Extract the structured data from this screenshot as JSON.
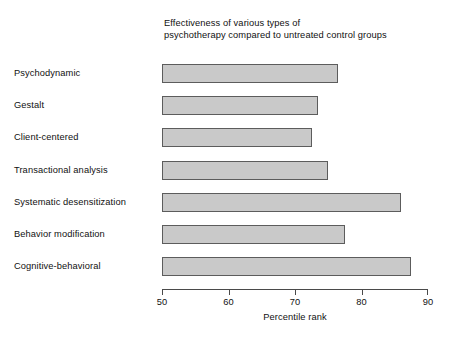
{
  "chart_data": {
    "type": "bar",
    "orientation": "horizontal",
    "title": "Effectiveness of various types of psychotherapy compared to untreated control groups",
    "title_lines": [
      "Effectiveness of various types of",
      "psychotherapy compared to untreated control groups"
    ],
    "categories": [
      "Psychodynamic",
      "Gestalt",
      "Client-centered",
      "Transactional analysis",
      "Systematic desensitization",
      "Behavior modification",
      "Cognitive-behavioral"
    ],
    "values": [
      76.5,
      73.5,
      72.5,
      75,
      86,
      77.5,
      87.5
    ],
    "xlabel": "Percentile rank",
    "ylabel": "",
    "xlim": [
      50,
      90
    ],
    "xticks": [
      50,
      60,
      70,
      80,
      90
    ],
    "xtick_labels": [
      "50",
      "60",
      "70",
      "80",
      "90"
    ],
    "grid": false,
    "legend": null,
    "bar_fill_color": "#c9c9c9",
    "bar_border_color": "#5c5c5c",
    "axis_color": "#4a4a4a",
    "background_color": "#ffffff"
  }
}
